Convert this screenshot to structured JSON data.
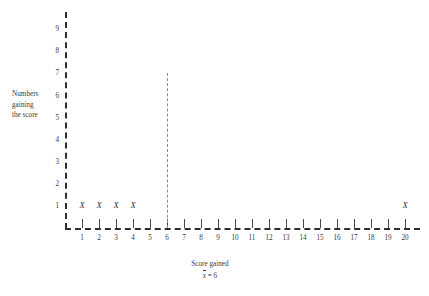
{
  "chart_data": {
    "type": "scatter",
    "title": "",
    "xlabel": "Score gained",
    "ylabel_lines": [
      "Numbers",
      "gaining",
      "the score"
    ],
    "ylabel": "Numbers gaining the score",
    "categories": [
      1,
      2,
      3,
      4,
      5,
      6,
      7,
      8,
      9,
      10,
      11,
      12,
      13,
      14,
      15,
      16,
      17,
      18,
      19,
      20
    ],
    "values": [
      1,
      1,
      1,
      1,
      0,
      0,
      0,
      0,
      0,
      0,
      0,
      0,
      0,
      0,
      0,
      0,
      0,
      0,
      0,
      1
    ],
    "points": [
      {
        "x": 1,
        "y": 1,
        "marker": "X"
      },
      {
        "x": 2,
        "y": 1,
        "marker": "X"
      },
      {
        "x": 3,
        "y": 1,
        "marker": "X"
      },
      {
        "x": 4,
        "y": 1,
        "marker": "X"
      },
      {
        "x": 20,
        "y": 1,
        "marker": "X"
      }
    ],
    "x_tick_labels": [
      "1",
      "2",
      "3",
      "4",
      "5",
      "6",
      "7",
      "8",
      "9",
      "10",
      "11",
      "12",
      "13",
      "14",
      "15",
      "16",
      "17",
      "18",
      "19",
      "20"
    ],
    "y_tick_labels": [
      "1",
      "2",
      "3",
      "4",
      "5",
      "6",
      "7",
      "8",
      "9"
    ],
    "xlim": [
      0,
      20.6
    ],
    "ylim": [
      0,
      10
    ],
    "grid": false,
    "legend": null,
    "annotations": [
      {
        "name": "mean-line",
        "type": "vertical-line",
        "x": 6,
        "y_top": 7,
        "style": "dashed",
        "color": "#8a8a8a"
      },
      {
        "name": "mean-label",
        "text": "x = 6",
        "symbol": "x-bar",
        "value": 6
      }
    ],
    "axis_style": "dashed"
  },
  "axes": {
    "y_title_line1": "Numbers",
    "y_title_line2": "gaining",
    "y_title_line3": "the score",
    "x_title": "Score gained"
  },
  "mean_label": {
    "symbol": "x",
    "equals": " = 6"
  },
  "colors": {
    "axis": "#2e2e2e",
    "mean_line": "#8a8a8a",
    "text": "#3a3a3a",
    "marker": "#2b2b2b",
    "background": "#ffffff"
  }
}
